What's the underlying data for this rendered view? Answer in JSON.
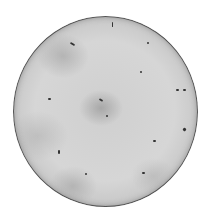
{
  "image": {
    "subject": "circular specimen plate photograph",
    "colors": {
      "background": "#ffffff",
      "plate": "#d2d2d2",
      "rim": "#555555",
      "spots": "#333333"
    },
    "spots": [
      {
        "x": 70,
        "y": 43,
        "w": 5,
        "h": 2,
        "r": 30
      },
      {
        "x": 147,
        "y": 42,
        "w": 2,
        "h": 2,
        "r": 0
      },
      {
        "x": 140,
        "y": 71,
        "w": 2,
        "h": 2,
        "r": 0
      },
      {
        "x": 176,
        "y": 89,
        "w": 3,
        "h": 2,
        "r": 0
      },
      {
        "x": 183,
        "y": 89,
        "w": 3,
        "h": 2,
        "r": 0
      },
      {
        "x": 48,
        "y": 98,
        "w": 3,
        "h": 2,
        "r": 0
      },
      {
        "x": 99,
        "y": 99,
        "w": 4,
        "h": 2,
        "r": 30
      },
      {
        "x": 106,
        "y": 115,
        "w": 2,
        "h": 2,
        "r": 0
      },
      {
        "x": 183,
        "y": 128,
        "w": 3,
        "h": 3,
        "r": 45
      },
      {
        "x": 153,
        "y": 140,
        "w": 3,
        "h": 2,
        "r": 0
      },
      {
        "x": 58,
        "y": 150,
        "w": 2,
        "h": 4,
        "r": 0
      },
      {
        "x": 142,
        "y": 172,
        "w": 3,
        "h": 2,
        "r": 0
      },
      {
        "x": 85,
        "y": 173,
        "w": 2,
        "h": 2,
        "r": 0
      },
      {
        "x": 112,
        "y": 22,
        "w": 1,
        "h": 5,
        "r": 0
      }
    ]
  }
}
